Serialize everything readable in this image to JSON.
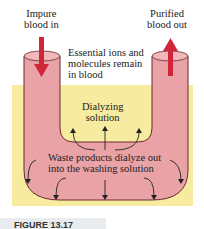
{
  "labels": {
    "impure_in": [
      "Impure",
      "blood in"
    ],
    "purified_out": [
      "Purified",
      "blood out"
    ],
    "essential": [
      "Essential ions and",
      "molecules remain",
      "in blood"
    ],
    "dialyzing": [
      "Dialyzing",
      "solution"
    ],
    "waste": [
      "Waste products dialyze out",
      "into the washing solution"
    ]
  },
  "caption": "FIGURE 13.17",
  "colors": {
    "bath": "#f6eb9f",
    "tube": "#e9a2a6",
    "tube_outline": "#6b2a2a",
    "arrow": "#d1253a"
  }
}
